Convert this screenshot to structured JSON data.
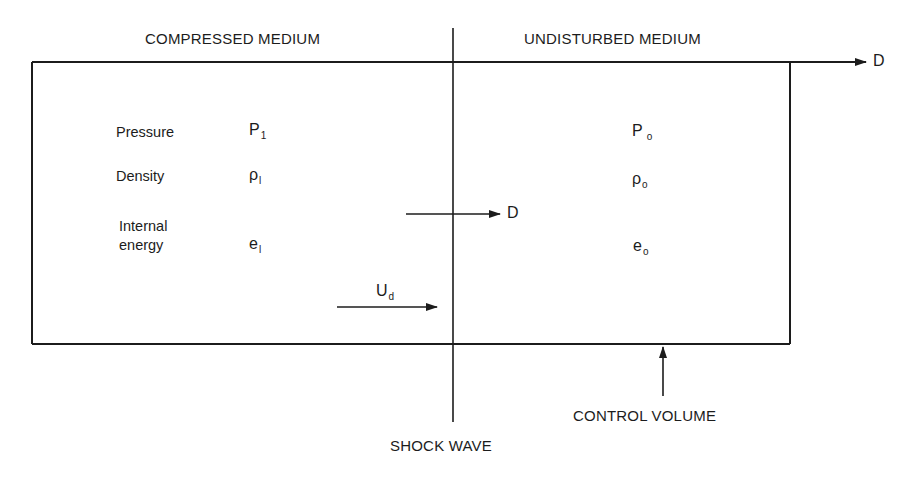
{
  "regions": {
    "left_title": "COMPRESSED MEDIUM",
    "right_title": "UNDISTURBED MEDIUM"
  },
  "properties": [
    {
      "name": "Pressure",
      "left_symbol": "P",
      "left_sub": "1",
      "right_symbol": "P",
      "right_sub": "o"
    },
    {
      "name": "Density",
      "left_symbol": "ρ",
      "left_sub": "l",
      "right_symbol": "ρ",
      "right_sub": "o"
    },
    {
      "name_line1": "Internal",
      "name_line2": "energy",
      "left_symbol": "e",
      "left_sub": "l",
      "right_symbol": "e",
      "right_sub": "o"
    }
  ],
  "arrows": {
    "top_velocity_label": "D",
    "shock_velocity_label": "D",
    "particle_velocity_label": "U",
    "particle_velocity_sub": "d"
  },
  "annotations": {
    "shock_wave": "SHOCK WAVE",
    "control_volume": "CONTROL VOLUME"
  },
  "colors": {
    "ink": "#1c1c1c",
    "background": "#ffffff"
  }
}
